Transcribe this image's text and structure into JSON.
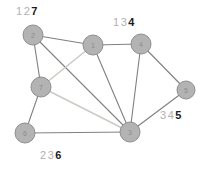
{
  "figure": {
    "title": "",
    "background": "#ffffff"
  },
  "style": {
    "node_fill": "#b3b3b3",
    "node_stroke": "#8f8f8f",
    "node_label_color": "#8c8c8c",
    "edge_dark": "#808080",
    "edge_light": "#c8cdc4",
    "annotation_dim_color": "#b0b0b0",
    "annotation_bold_color": "#1a1a1a"
  },
  "graph": {
    "nodes": [
      {
        "id": "n1",
        "label": "1",
        "x": 93,
        "y": 45,
        "r": 10
      },
      {
        "id": "n2",
        "label": "2",
        "x": 33,
        "y": 35,
        "r": 10
      },
      {
        "id": "n3",
        "label": "3",
        "x": 130,
        "y": 132,
        "r": 10
      },
      {
        "id": "n4",
        "label": "4",
        "x": 141,
        "y": 44,
        "r": 10
      },
      {
        "id": "n5",
        "label": "5",
        "x": 186,
        "y": 90,
        "r": 9
      },
      {
        "id": "n6",
        "label": "6",
        "x": 25,
        "y": 133,
        "r": 10
      },
      {
        "id": "n7",
        "label": "7",
        "x": 41,
        "y": 87,
        "r": 10
      }
    ],
    "edges": [
      {
        "from": "n2",
        "to": "n1",
        "shade": "dark"
      },
      {
        "from": "n2",
        "to": "n7",
        "shade": "dark"
      },
      {
        "from": "n2",
        "to": "n3",
        "shade": "dark"
      },
      {
        "from": "n1",
        "to": "n4",
        "shade": "dark"
      },
      {
        "from": "n1",
        "to": "n3",
        "shade": "dark"
      },
      {
        "from": "n1",
        "to": "n7",
        "shade": "light"
      },
      {
        "from": "n4",
        "to": "n3",
        "shade": "dark"
      },
      {
        "from": "n4",
        "to": "n5",
        "shade": "dark"
      },
      {
        "from": "n5",
        "to": "n3",
        "shade": "dark"
      },
      {
        "from": "n7",
        "to": "n3",
        "shade": "light"
      },
      {
        "from": "n7",
        "to": "n6",
        "shade": "dark"
      },
      {
        "from": "n6",
        "to": "n3",
        "shade": "dark"
      }
    ]
  },
  "annotations": [
    {
      "id": "label-top-left",
      "x": 16,
      "y": 6,
      "tokens": [
        {
          "text": "1",
          "bold": false
        },
        {
          "text": "2",
          "bold": false
        },
        {
          "text": "7",
          "bold": true
        }
      ]
    },
    {
      "id": "label-top-right",
      "x": 113,
      "y": 17,
      "tokens": [
        {
          "text": "1",
          "bold": false
        },
        {
          "text": "3",
          "bold": false
        },
        {
          "text": "4",
          "bold": true
        }
      ]
    },
    {
      "id": "label-right",
      "x": 160,
      "y": 110,
      "tokens": [
        {
          "text": "3",
          "bold": false
        },
        {
          "text": "4",
          "bold": false
        },
        {
          "text": "5",
          "bold": true
        }
      ]
    },
    {
      "id": "label-bottom",
      "x": 40,
      "y": 150,
      "tokens": [
        {
          "text": "2",
          "bold": false
        },
        {
          "text": "3",
          "bold": false
        },
        {
          "text": "6",
          "bold": true
        }
      ]
    }
  ]
}
